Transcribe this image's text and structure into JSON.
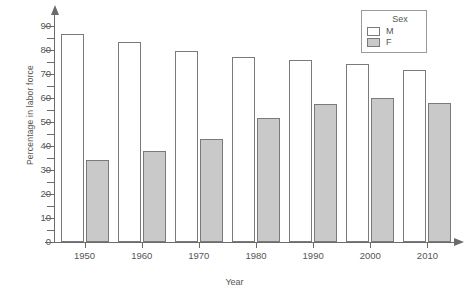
{
  "chart_data": {
    "type": "bar",
    "title": "",
    "xlabel": "Year",
    "ylabel": "Percentage in labor force",
    "categories": [
      "1950",
      "1960",
      "1970",
      "1980",
      "1990",
      "2000",
      "2010"
    ],
    "series": [
      {
        "name": "M",
        "color": "#ffffff",
        "values": [
          86.5,
          83.5,
          79.5,
          77.0,
          76.0,
          74.0,
          71.5
        ]
      },
      {
        "name": "F",
        "color": "#c9c9c9",
        "values": [
          34.0,
          38.0,
          43.0,
          51.5,
          57.5,
          60.0,
          58.0
        ]
      }
    ],
    "ylim": [
      0,
      95
    ],
    "yticks_major": [
      0,
      10,
      20,
      30,
      40,
      50,
      60,
      70,
      80,
      90
    ],
    "yticks_minor": [
      5,
      15,
      25,
      35,
      45,
      55,
      65,
      75,
      85
    ],
    "grid": false,
    "legend": {
      "title": "Sex",
      "position": "top-right",
      "entries": [
        {
          "label": "M",
          "swatch": "open"
        },
        {
          "label": "F",
          "swatch": "filled"
        }
      ]
    },
    "axis_color": "#6b6b6b",
    "bar_border_color": "#7a7a7a",
    "text_color": "#555555"
  }
}
